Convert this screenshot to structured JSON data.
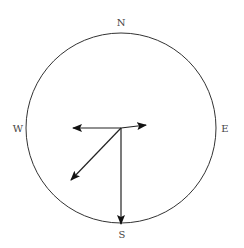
{
  "diagram": {
    "type": "compass-vector-diagram",
    "labels": {
      "north": "N",
      "south": "S",
      "east": "E",
      "west": "W"
    },
    "circle": {
      "cx": 121,
      "cy": 128,
      "r": 95,
      "stroke": "#333333"
    },
    "origin": {
      "x": 121,
      "y": 128
    },
    "vectors": [
      {
        "name": "west-vector",
        "direction": "W",
        "tip": {
          "x": 73,
          "y": 128
        }
      },
      {
        "name": "east-vector",
        "direction": "E (slightly north)",
        "tip": {
          "x": 146,
          "y": 125
        }
      },
      {
        "name": "southwest-vector",
        "direction": "SW",
        "tip": {
          "x": 71,
          "y": 180
        }
      },
      {
        "name": "south-vector",
        "direction": "S",
        "tip": {
          "x": 121,
          "y": 224
        }
      }
    ],
    "colors": {
      "line": "#222222",
      "text": "#444444",
      "background": "#ffffff"
    }
  }
}
